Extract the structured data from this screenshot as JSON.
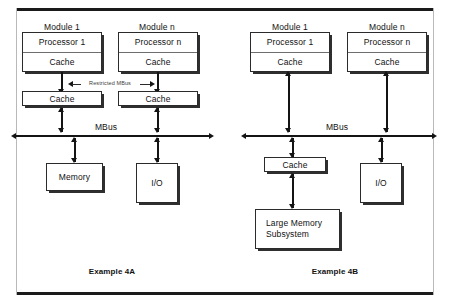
{
  "figure": {
    "examples": [
      {
        "id": "4a",
        "caption": "Example 4A",
        "modules": [
          {
            "title": "Module 1",
            "processor": "Processor 1",
            "cache": "Cache"
          },
          {
            "title": "Module n",
            "processor": "Processor n",
            "cache": "Cache"
          }
        ],
        "second_level_caches": [
          "Cache",
          "Cache"
        ],
        "restricted_bus_label": "Restricted MBus",
        "bus_label": "MBus",
        "peripherals": [
          {
            "label": "Memory"
          },
          {
            "label": "I/O"
          }
        ]
      },
      {
        "id": "4b",
        "caption": "Example 4B",
        "modules": [
          {
            "title": "Module 1",
            "processor": "Processor 1",
            "cache": "Cache"
          },
          {
            "title": "Module n",
            "processor": "Processor n",
            "cache": "Cache"
          }
        ],
        "bus_label": "MBus",
        "shared_cache": "Cache",
        "memory_subsystem": "Large Memory Subsystem",
        "peripherals": [
          {
            "label": "I/O"
          }
        ]
      }
    ]
  },
  "colors": {
    "ink": "#141414",
    "rule": "#1a1a1a",
    "shadow": "#2f2f2f",
    "page": "#ffffff"
  }
}
